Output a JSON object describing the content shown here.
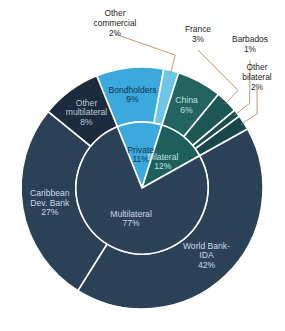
{
  "chart_data": {
    "type": "pie",
    "title": "",
    "subtitle": "",
    "xlabel": "",
    "ylabel": "",
    "layout": {
      "variant": "nested-donut-sunburst",
      "center_x": 142,
      "center_y": 188,
      "inner_ring_radius": 66,
      "outer_ring_radius": 121,
      "start_angle_deg": -22,
      "direction": "clockwise",
      "separator_color": "#ffffff",
      "legend": "none",
      "grid": false,
      "value_unit": "percent"
    },
    "rings": [
      {
        "name": "inner",
        "categories": [
          "Private",
          "Bilateral",
          "Multilateral"
        ],
        "values": [
          11,
          12,
          77
        ]
      },
      {
        "name": "outer",
        "categories": [
          "Bondholders",
          "Other commercial",
          "China",
          "France",
          "Barbados",
          "Other bilateral",
          "World Bank-IDA",
          "Caribbean Dev. Bank",
          "Other multilateral"
        ],
        "values": [
          9,
          2,
          6,
          3,
          1,
          2,
          42,
          27,
          8
        ]
      }
    ],
    "inner_slices": [
      {
        "label": "Private",
        "value": 11,
        "value_text": "11%",
        "color": "#3ba8de",
        "text_color": "#17384f"
      },
      {
        "label": "Bilateral",
        "value": 12,
        "value_text": "12%",
        "color": "#1e5f5d",
        "text_color": "#bfe3e2"
      },
      {
        "label": "Multilateral",
        "value": 77,
        "value_text": "77%",
        "color": "#2c4259",
        "text_color": "#c9d6e2"
      }
    ],
    "outer_slices": [
      {
        "label": "Bondholders",
        "value": 9,
        "value_text": "9%",
        "color": "#3ba8de",
        "text_color": "#14364d",
        "label_placement": "inside"
      },
      {
        "label": "Other commercial",
        "value": 2,
        "value_text": "2%",
        "color": "#6fc5e8",
        "text_color": "#231f20",
        "label_placement": "callout"
      },
      {
        "label": "China",
        "value": 6,
        "value_text": "6%",
        "color": "#23645f",
        "text_color": "#bfe0dd",
        "label_placement": "inside"
      },
      {
        "label": "France",
        "value": 3,
        "value_text": "3%",
        "color": "#1d5755",
        "text_color": "#231f20",
        "label_placement": "callout"
      },
      {
        "label": "Barbados",
        "value": 1,
        "value_text": "1%",
        "color": "#1a4f4d",
        "text_color": "#231f20",
        "label_placement": "callout"
      },
      {
        "label": "Other bilateral",
        "value": 2,
        "value_text": "2%",
        "color": "#17474a",
        "text_color": "#231f20",
        "label_placement": "callout"
      },
      {
        "label": "World Bank-IDA",
        "value": 42,
        "value_text": "42%",
        "color": "#2b4158",
        "text_color": "#ccd8e4",
        "label_placement": "inside"
      },
      {
        "label": "Caribbean Dev. Bank",
        "value": 27,
        "value_text": "27%",
        "color": "#2b4158",
        "text_color": "#ccd8e4",
        "label_placement": "inside"
      },
      {
        "label": "Other multilateral",
        "value": 8,
        "value_text": "8%",
        "color": "#1c2c3e",
        "text_color": "#b9c6d4",
        "label_placement": "inside"
      }
    ],
    "callouts": [
      {
        "label": "Other\ncommercial",
        "value_text": "2%",
        "x": 82,
        "y": 8,
        "w": 66,
        "line_color": "#c08860"
      },
      {
        "label": "France",
        "value_text": "3%",
        "x": 176,
        "y": 24,
        "w": 44,
        "line_color": "#c08860"
      },
      {
        "label": "Barbados",
        "value_text": "1%",
        "x": 222,
        "y": 34,
        "w": 56,
        "line_color": "#c08860"
      },
      {
        "label": "Other\nbilateral",
        "value_text": "2%",
        "x": 232,
        "y": 62,
        "w": 50,
        "line_color": "#c08860"
      }
    ],
    "colors": {
      "private_blue": "#3ba8de",
      "light_blue": "#6fc5e8",
      "bilateral_teal": "#1e5f5d",
      "multilateral_navy": "#2c4259",
      "other_multilateral_navy": "#1c2c3e",
      "separator": "#ffffff",
      "leader_line": "#c08860",
      "background": "#ffffff"
    }
  }
}
